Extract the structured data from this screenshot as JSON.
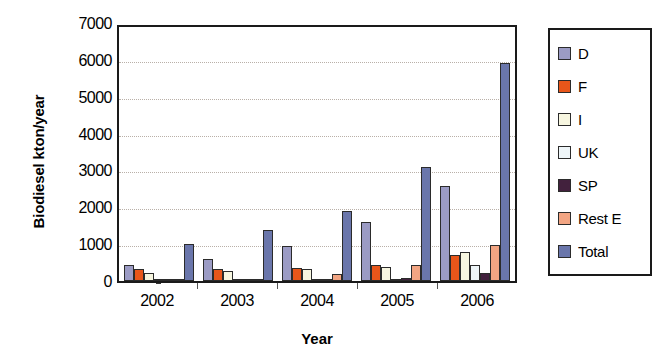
{
  "chart_data": {
    "type": "bar",
    "title": "",
    "xlabel": "Year",
    "ylabel": "Biodiesel kton/year",
    "categories": [
      "2002",
      "2003",
      "2004",
      "2005",
      "2006"
    ],
    "ylim": [
      0,
      7000
    ],
    "yticks": [
      0,
      1000,
      2000,
      3000,
      4000,
      5000,
      6000,
      7000
    ],
    "ytick_labels": [
      "0",
      "1000",
      "2000",
      "3000",
      "4000",
      "5000",
      "6000",
      "7000"
    ],
    "grid": true,
    "legend_position": "right",
    "series": [
      {
        "name": "D",
        "color": "#9b9bc4",
        "values": [
          450,
          620,
          960,
          1620,
          2620
        ]
      },
      {
        "name": "F",
        "color": "#e8561a",
        "values": [
          340,
          340,
          350,
          440,
          720
        ]
      },
      {
        "name": "I",
        "color": "#f7f6e0",
        "values": [
          210,
          280,
          330,
          390,
          800
        ]
      },
      {
        "name": "UK",
        "color": "#eef5f8",
        "values": [
          5,
          10,
          10,
          50,
          450
        ]
      },
      {
        "name": "SP",
        "color": "#42213d",
        "values": [
          0,
          0,
          10,
          70,
          220
        ]
      },
      {
        "name": "Rest E",
        "color": "#f2a583",
        "values": [
          30,
          60,
          180,
          450,
          1000
        ]
      },
      {
        "name": "Total",
        "color": "#6a76ab",
        "values": [
          1030,
          1400,
          1930,
          3150,
          6000
        ]
      }
    ]
  },
  "axis": {
    "y_title": "Biodiesel kton/year",
    "x_title": "Year"
  }
}
